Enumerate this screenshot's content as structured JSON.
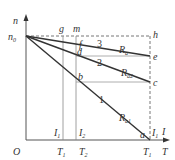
{
  "diagram": {
    "axes": {
      "y_label": "n",
      "x_label_top": "I",
      "x_label_bottom": "T",
      "origin": "O",
      "n0": "n",
      "n0_sub": "0"
    },
    "points": {
      "g": "g",
      "m": "m",
      "h": "h",
      "f": "f",
      "d": "d",
      "e": "e",
      "c": "c",
      "b": "b",
      "a": "a"
    },
    "lines": [
      {
        "id": "1",
        "label": "1",
        "resistor": "R",
        "resistor_sub": "a1"
      },
      {
        "id": "2",
        "label": "2",
        "resistor": "R",
        "resistor_sub": "a2"
      },
      {
        "id": "3",
        "label": "3",
        "resistor": "R",
        "resistor_sub": "a"
      }
    ],
    "ticks": {
      "I1a": {
        "main": "I",
        "sub": "1"
      },
      "I2": {
        "main": "I",
        "sub": "2"
      },
      "I1b": {
        "main": "I",
        "sub": "1"
      },
      "T1a": {
        "main": "T",
        "sub": "1"
      },
      "T2": {
        "main": "T",
        "sub": "2"
      },
      "T1b": {
        "main": "T",
        "sub": "1"
      }
    }
  }
}
